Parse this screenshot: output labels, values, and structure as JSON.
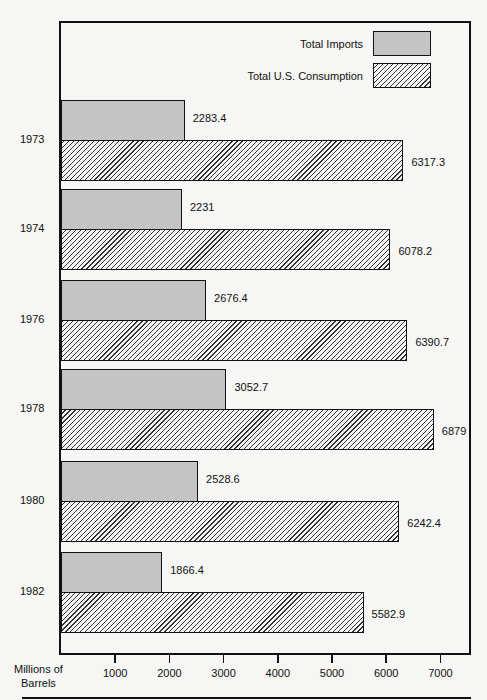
{
  "chart_data": {
    "type": "bar",
    "orientation": "horizontal",
    "title": "",
    "xlabel": "Millions of Barrels",
    "ylabel": "",
    "xlim": [
      0,
      7500
    ],
    "x_ticks": [
      1000,
      2000,
      3000,
      4000,
      5000,
      6000,
      7000
    ],
    "grid": false,
    "legend_position": "top-right",
    "categories": [
      "1973",
      "1974",
      "1976",
      "1978",
      "1980",
      "1982"
    ],
    "series": [
      {
        "name": "Total Imports",
        "pattern": "stipple-gray",
        "values": [
          2283.4,
          2231,
          2676.4,
          3052.7,
          2528.6,
          1866.4
        ]
      },
      {
        "name": "Total U.S. Consumption",
        "pattern": "diagonal-hatch",
        "values": [
          6317.3,
          6078.2,
          6390.7,
          6879,
          6242.4,
          5582.9
        ]
      }
    ]
  },
  "legend": {
    "imports_label": "Total Imports",
    "consumption_label": "Total U.S. Consumption"
  },
  "axis": {
    "unit_line1": "Millions of",
    "unit_line2": "Barrels",
    "ticks": [
      "1000",
      "2000",
      "3000",
      "4000",
      "5000",
      "6000",
      "7000"
    ]
  },
  "labels": {
    "years": [
      "1973",
      "1974",
      "1976",
      "1978",
      "1980",
      "1982"
    ],
    "imports": [
      "2283.4",
      "2231",
      "2676.4",
      "3052.7",
      "2528.6",
      "1866.4"
    ],
    "consumption": [
      "6317.3",
      "6078.2",
      "6390.7",
      "6879",
      "6242.4",
      "5582.9"
    ]
  }
}
